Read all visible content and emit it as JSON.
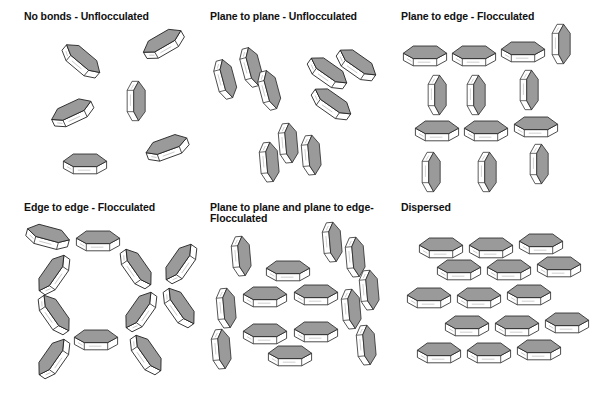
{
  "figure": {
    "colors": {
      "face": "#9a9a9a",
      "side": "#ffffff",
      "stroke": "#222222",
      "background": "#ffffff"
    },
    "panels": [
      {
        "id": "no-bonds",
        "title": "No bonds - Unflocculated",
        "title_pos": [
          24,
          11
        ],
        "particles": [
          {
            "x": 82,
            "y": 60,
            "rot": 40
          },
          {
            "x": 163,
            "y": 43,
            "rot": -30
          },
          {
            "x": 72,
            "y": 112,
            "rot": -25
          },
          {
            "x": 137,
            "y": 101,
            "rot": 90
          },
          {
            "x": 167,
            "y": 147,
            "rot": -20
          },
          {
            "x": 85,
            "y": 163,
            "rot": 0
          }
        ]
      },
      {
        "id": "plane-to-plane-unflocculated",
        "title": "Plane to plane - Unflocculated",
        "title_pos": [
          210,
          11
        ],
        "particles": [
          {
            "x": 226,
            "y": 79,
            "rot": 75
          },
          {
            "x": 252,
            "y": 67,
            "rot": 75
          },
          {
            "x": 270,
            "y": 90,
            "rot": 75
          },
          {
            "x": 328,
            "y": 72,
            "rot": 35
          },
          {
            "x": 357,
            "y": 64,
            "rot": 35
          },
          {
            "x": 332,
            "y": 103,
            "rot": 35
          },
          {
            "x": 270,
            "y": 162,
            "rot": 85
          },
          {
            "x": 289,
            "y": 143,
            "rot": 85
          },
          {
            "x": 312,
            "y": 155,
            "rot": 85
          }
        ]
      },
      {
        "id": "plane-to-edge-flocculated",
        "title": "Plane to edge - Flocculated",
        "title_pos": [
          401,
          11
        ],
        "particles": [
          {
            "x": 425,
            "y": 55,
            "rot": 0
          },
          {
            "x": 474,
            "y": 55,
            "rot": 0
          },
          {
            "x": 523,
            "y": 51,
            "rot": 0
          },
          {
            "x": 562,
            "y": 44,
            "rot": 90
          },
          {
            "x": 438,
            "y": 95,
            "rot": 90
          },
          {
            "x": 477,
            "y": 95,
            "rot": 90
          },
          {
            "x": 530,
            "y": 90,
            "rot": 90
          },
          {
            "x": 437,
            "y": 130,
            "rot": 0
          },
          {
            "x": 486,
            "y": 130,
            "rot": 0
          },
          {
            "x": 536,
            "y": 126,
            "rot": 0
          },
          {
            "x": 432,
            "y": 172,
            "rot": 90
          },
          {
            "x": 488,
            "y": 172,
            "rot": 90
          },
          {
            "x": 540,
            "y": 164,
            "rot": 90
          }
        ]
      },
      {
        "id": "edge-to-edge-flocculated",
        "title": "Edge to edge - Flocculated",
        "title_pos": [
          24,
          202
        ],
        "particles": [
          {
            "x": 48,
            "y": 236,
            "rot": 15
          },
          {
            "x": 98,
            "y": 240,
            "rot": 0
          },
          {
            "x": 53,
            "y": 274,
            "rot": -55
          },
          {
            "x": 137,
            "y": 268,
            "rot": 55
          },
          {
            "x": 180,
            "y": 263,
            "rot": -55
          },
          {
            "x": 55,
            "y": 314,
            "rot": 55
          },
          {
            "x": 140,
            "y": 311,
            "rot": -55
          },
          {
            "x": 180,
            "y": 307,
            "rot": 55
          },
          {
            "x": 96,
            "y": 339,
            "rot": 0
          },
          {
            "x": 53,
            "y": 358,
            "rot": -55
          },
          {
            "x": 147,
            "y": 354,
            "rot": 55
          }
        ]
      },
      {
        "id": "plane-to-plane-and-plane-to-edge",
        "title": "Plane to plane and plane to edge-\nFlocculated",
        "title_pos": [
          210,
          202
        ],
        "particles": [
          {
            "x": 242,
            "y": 256,
            "rot": 85
          },
          {
            "x": 288,
            "y": 270,
            "rot": 0
          },
          {
            "x": 333,
            "y": 242,
            "rot": 85
          },
          {
            "x": 356,
            "y": 257,
            "rot": 85
          },
          {
            "x": 227,
            "y": 308,
            "rot": 85
          },
          {
            "x": 265,
            "y": 296,
            "rot": 0
          },
          {
            "x": 316,
            "y": 294,
            "rot": 0
          },
          {
            "x": 370,
            "y": 290,
            "rot": 85
          },
          {
            "x": 352,
            "y": 309,
            "rot": 85
          },
          {
            "x": 265,
            "y": 333,
            "rot": 0
          },
          {
            "x": 316,
            "y": 331,
            "rot": 0
          },
          {
            "x": 222,
            "y": 349,
            "rot": 85
          },
          {
            "x": 290,
            "y": 355,
            "rot": 0
          },
          {
            "x": 367,
            "y": 345,
            "rot": 85
          }
        ]
      },
      {
        "id": "dispersed",
        "title": "Dispersed",
        "title_pos": [
          401,
          202
        ],
        "particles": [
          {
            "x": 441,
            "y": 247,
            "rot": 0
          },
          {
            "x": 491,
            "y": 247,
            "rot": 0
          },
          {
            "x": 541,
            "y": 243,
            "rot": 0
          },
          {
            "x": 459,
            "y": 269,
            "rot": 0
          },
          {
            "x": 509,
            "y": 269,
            "rot": 0
          },
          {
            "x": 559,
            "y": 266,
            "rot": 0
          },
          {
            "x": 429,
            "y": 297,
            "rot": 0
          },
          {
            "x": 479,
            "y": 297,
            "rot": 0
          },
          {
            "x": 529,
            "y": 294,
            "rot": 0
          },
          {
            "x": 467,
            "y": 325,
            "rot": 0
          },
          {
            "x": 517,
            "y": 325,
            "rot": 0
          },
          {
            "x": 567,
            "y": 322,
            "rot": 0
          },
          {
            "x": 439,
            "y": 352,
            "rot": 0
          },
          {
            "x": 489,
            "y": 352,
            "rot": 0
          },
          {
            "x": 539,
            "y": 349,
            "rot": 0
          }
        ]
      }
    ]
  }
}
